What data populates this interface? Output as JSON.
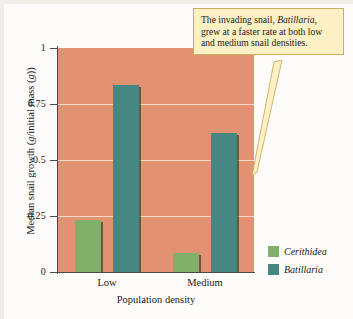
{
  "chart_data": {
    "type": "bar",
    "title": "",
    "categories": [
      "Low",
      "Medium"
    ],
    "series": [
      {
        "name": "Cerithidea",
        "values": [
          0.23,
          0.085
        ],
        "color": "#82b06b"
      },
      {
        "name": "Batillaria",
        "values": [
          0.835,
          0.62
        ],
        "color": "#468683"
      }
    ],
    "xlabel": "Population density",
    "ylabel": "Median snail growth (g/initial mass (g))",
    "ylim": [
      0,
      1
    ],
    "yticks": [
      "0",
      "0.25",
      "0.5",
      "0.75",
      "1"
    ],
    "ytick_values": [
      0,
      0.25,
      0.5,
      0.75,
      1
    ],
    "grid": true,
    "legend_position": "right-bottom",
    "plot_background": "#e09272",
    "gridline_color": "#f6d9c8",
    "annotations": [
      {
        "text_parts": [
          {
            "text": "The invading snail, ",
            "style": "normal"
          },
          {
            "text": "Batillaria",
            "style": "italic"
          },
          {
            "text": ", grew at a faster rate at both low and medium snail densities.",
            "style": "normal"
          }
        ],
        "full_text": "The invading snail, Batillaria, grew at a faster rate at both low and medium snail densities.",
        "background": "#fdf0c4",
        "border": "#c9ad62",
        "points_to": "Batillaria bar at Medium density"
      }
    ]
  },
  "axes": {
    "y_title_lead": "Median snail growth (",
    "y_title_italic_1": "g",
    "y_title_mid": "/initial mass (",
    "y_title_italic_2": "g",
    "y_title_tail": "))",
    "x_title": "Population density"
  },
  "legend": {
    "items": [
      {
        "label": "Cerithidea",
        "color": "#82b06b"
      },
      {
        "label": "Batillaria",
        "color": "#468683"
      }
    ]
  },
  "callout": {
    "lead": "The invading snail, ",
    "species": "Batillaria",
    "tail": ", grew at a faster rate at both low and medium snail densities."
  }
}
